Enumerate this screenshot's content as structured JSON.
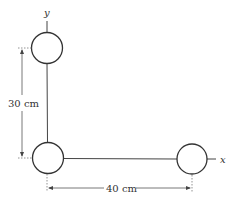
{
  "diagram": {
    "type": "mass-configuration",
    "axes": {
      "x_label": "x",
      "y_label": "y"
    },
    "masses": [
      {
        "id": "top",
        "position": "on y-axis",
        "cx": 47,
        "cy": 48,
        "r": 15
      },
      {
        "id": "origin",
        "position": "origin",
        "cx": 48,
        "cy": 158,
        "r": 15
      },
      {
        "id": "right",
        "position": "on x-axis",
        "cx": 192,
        "cy": 159,
        "r": 15
      }
    ],
    "dimensions": {
      "vertical": {
        "label": "30 cm"
      },
      "horizontal": {
        "label": "40 cm"
      }
    },
    "colors": {
      "stroke": "#333333",
      "dim_stroke": "#555555",
      "background": "#ffffff"
    }
  }
}
